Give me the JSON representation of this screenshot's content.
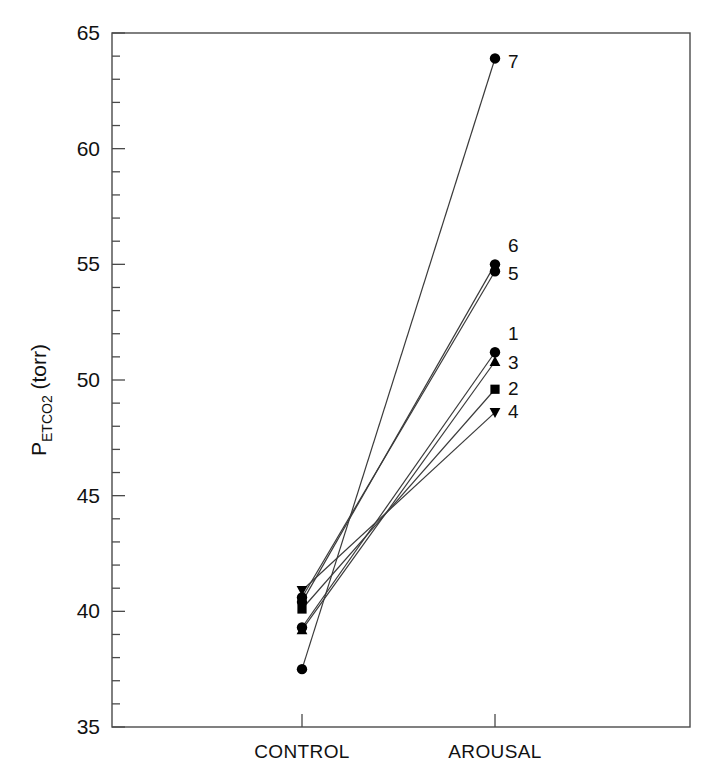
{
  "chart_data": {
    "type": "line",
    "title": "",
    "xlabel": "",
    "ylabel": "P_ETCO2 (torr)",
    "ylabel_main_prefix": "P",
    "ylabel_subscript": "ETCO2",
    "ylabel_main_suffix": " (torr)",
    "categories": [
      "CONTROL",
      "AROUSAL"
    ],
    "ylim": [
      35,
      65
    ],
    "yticks_major": [
      35,
      40,
      45,
      50,
      55,
      60,
      65
    ],
    "yticks_major_labels": [
      "35",
      "40",
      "45",
      "50",
      "55",
      "60",
      "65"
    ],
    "ytick_minor_step": 1,
    "grid": false,
    "legend": "none",
    "series": [
      {
        "name": "1",
        "label": "1",
        "marker": "circle",
        "values": [
          39.3,
          51.2
        ]
      },
      {
        "name": "2",
        "label": "2",
        "marker": "square",
        "values": [
          40.1,
          49.6
        ]
      },
      {
        "name": "3",
        "label": "3",
        "marker": "triangle-up",
        "values": [
          39.2,
          50.8
        ]
      },
      {
        "name": "4",
        "label": "4",
        "marker": "triangle-down",
        "values": [
          40.9,
          48.6
        ]
      },
      {
        "name": "5",
        "label": "5",
        "marker": "circle",
        "values": [
          40.6,
          54.7
        ]
      },
      {
        "name": "6",
        "label": "6",
        "marker": "circle",
        "values": [
          40.4,
          55.0
        ]
      },
      {
        "name": "7",
        "label": "7",
        "marker": "circle",
        "values": [
          37.5,
          63.9
        ]
      }
    ],
    "point_labels": [
      {
        "text": "7",
        "series": "7",
        "at": "AROUSAL"
      },
      {
        "text": "6",
        "series": "6",
        "at": "AROUSAL"
      },
      {
        "text": "5",
        "series": "5",
        "at": "AROUSAL"
      },
      {
        "text": "1",
        "series": "1",
        "at": "AROUSAL"
      },
      {
        "text": "3",
        "series": "3",
        "at": "AROUSAL"
      },
      {
        "text": "2",
        "series": "2",
        "at": "AROUSAL"
      },
      {
        "text": "4",
        "series": "4",
        "at": "AROUSAL"
      }
    ],
    "colors": {
      "line": "#3a3a3a",
      "marker": "#000000",
      "axis": "#4a4a4a",
      "text": "#111111",
      "background": "#ffffff"
    }
  }
}
